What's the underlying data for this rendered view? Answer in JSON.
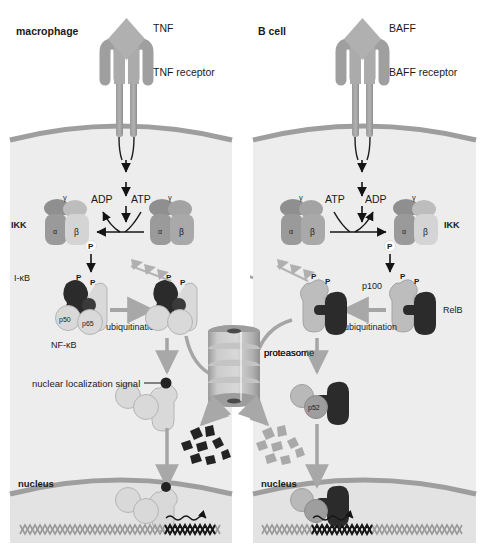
{
  "figure": {
    "title": "",
    "panels": [
      {
        "id": "left",
        "cell_label": "macrophage",
        "ligand": "TNF",
        "receptor": "BAFF receptor placeholder",
        "receptor_label": "TNF receptor",
        "kinase_label": "IKK",
        "kinase_subunits": [
          "α",
          "β",
          "γ"
        ],
        "nucleotide_left": "ADP",
        "nucleotide_right": "ATP",
        "inhibitor_label": "I-κB",
        "complex_label": "NF-κB",
        "dimer_subunits": [
          "p50",
          "p65"
        ],
        "process_label": "ubiquitination",
        "nls_label": "nuclear localization signal",
        "nucleus_label": "nucleus",
        "phospho_label": "P"
      },
      {
        "id": "right",
        "cell_label": "B cell",
        "ligand": "BAFF",
        "receptor_label": "BAFF receptor",
        "kinase_label": "IKK",
        "kinase_subunits": [
          "α",
          "β",
          "γ"
        ],
        "nucleotide_left": "ATP",
        "nucleotide_right": "ADP",
        "precursor_label": "p100",
        "partner_label": "RelB",
        "processed_label": "p52",
        "process_label": "ubiquitination",
        "nucleus_label": "nucleus",
        "phospho_label": "P"
      }
    ],
    "shared": {
      "proteasome_label": "proteasome"
    },
    "colors": {
      "background": "#ffffff",
      "cell_fill": "#ededed",
      "cell_fill_alt": "#e8e8e8",
      "membrane": "#9e9e9e",
      "protein_light": "#d6d6d6",
      "protein_mid": "#a8a8a8",
      "protein_dark": "#2e2e2e",
      "arrow_gray": "#a5a5a5",
      "arrow_black": "#141414",
      "text": "#1a1a1a",
      "dna": "#8c8c8c",
      "dna_active": "#171717"
    }
  }
}
